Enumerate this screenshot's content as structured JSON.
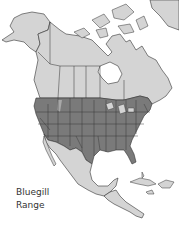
{
  "map": {
    "title": "Bluegill Range",
    "region": "North America",
    "label_line1": "Bluegill",
    "label_line2": "Range",
    "colors": {
      "background": "#ffffff",
      "land_outside_range": "#d4d4d4",
      "land_in_range": "#7a7a7a",
      "borders": "#333333",
      "water": "#ffffff"
    },
    "regions": [
      {
        "name": "Alaska",
        "in_range": false
      },
      {
        "name": "Canada",
        "in_range": false
      },
      {
        "name": "Contiguous United States",
        "in_range": true
      },
      {
        "name": "Northern Mexico (partial)",
        "in_range": true
      },
      {
        "name": "Mexico",
        "in_range": false
      },
      {
        "name": "Central America",
        "in_range": false
      },
      {
        "name": "Caribbean islands",
        "in_range": false
      },
      {
        "name": "Greenland (partial)",
        "in_range": false
      }
    ]
  }
}
